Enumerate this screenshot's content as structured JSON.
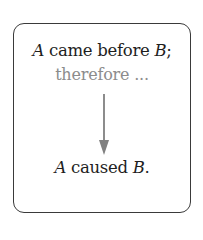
{
  "diagram": {
    "premise": {
      "subject": "A",
      "verb_phrase": " came before ",
      "object": "B",
      "punct": ";"
    },
    "connector": "therefore ...",
    "conclusion": {
      "subject": "A",
      "verb_phrase": " caused ",
      "object": "B",
      "punct": "."
    },
    "colors": {
      "text": "#1e1e1e",
      "connector": "#8c8c8c",
      "arrow": "#808080",
      "border": "#3a3a3a"
    }
  }
}
